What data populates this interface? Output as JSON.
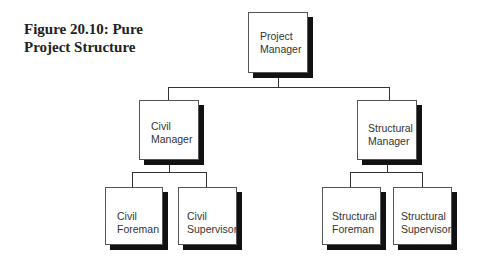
{
  "figure": {
    "title_line1": "Figure 20.10: Pure",
    "title_line2": "Project Structure"
  },
  "org_chart": {
    "root": {
      "line1": "Project",
      "line2": "Manager"
    },
    "managers": [
      {
        "line1": "Civil",
        "line2": "Manager",
        "reports": [
          {
            "line1": "Civil",
            "line2": "Foreman"
          },
          {
            "line1": "Civil",
            "line2": "Supervisor"
          }
        ]
      },
      {
        "line1": "Structural",
        "line2": "Manager",
        "reports": [
          {
            "line1": "Structural",
            "line2": "Foreman"
          },
          {
            "line1": "Structural",
            "line2": "Supervisor"
          }
        ]
      }
    ]
  }
}
